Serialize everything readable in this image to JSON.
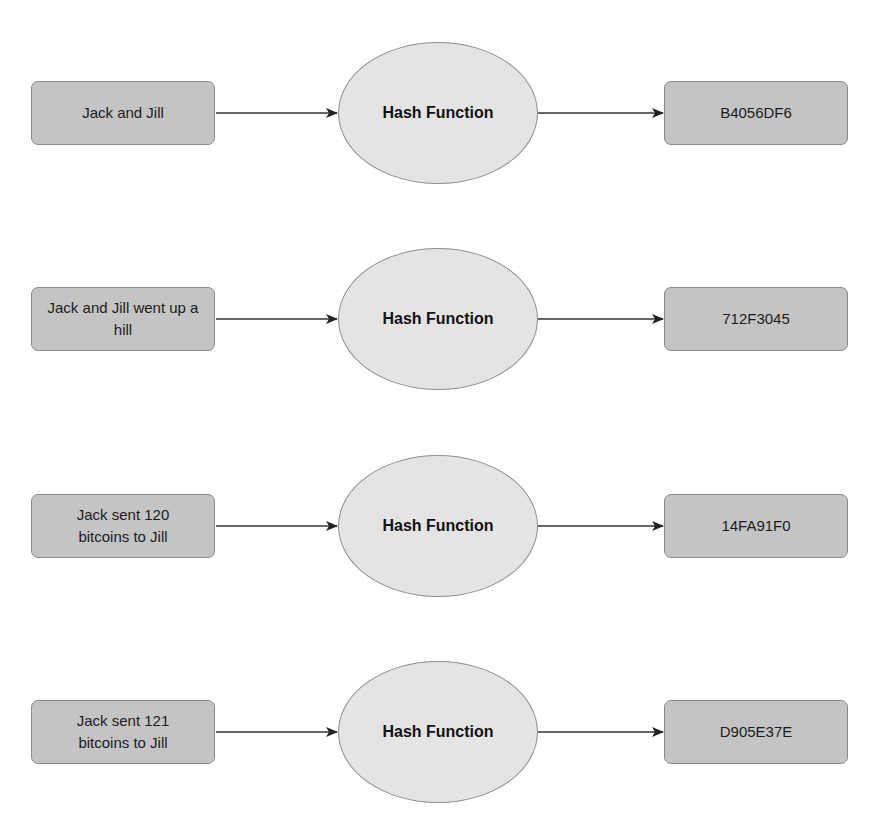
{
  "diagram": {
    "type": "flow",
    "colors": {
      "input_box": "#c4c4c4",
      "output_box": "#c4c4c4",
      "hash_node": "#e4e4e4",
      "stroke": "#8a8a8a",
      "arrow": "#222222"
    },
    "rows": [
      {
        "input": "Jack and Jill",
        "function": "Hash Function",
        "output": "B4056DF6"
      },
      {
        "input": "Jack and Jill went up a hill",
        "function": "Hash Function",
        "output": "712F3045"
      },
      {
        "input": "Jack sent 120 bitcoins to Jill",
        "function": "Hash Function",
        "output": "14FA91F0"
      },
      {
        "input": "Jack sent 121 bitcoins to Jill",
        "function": "Hash Function",
        "output": "D905E37E"
      }
    ]
  }
}
